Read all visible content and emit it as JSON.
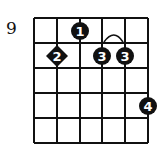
{
  "diagram": {
    "type": "guitar-chord-diagram",
    "start_fret_label": "9",
    "strings": 6,
    "frets": 5,
    "fingers": [
      {
        "finger": "1",
        "string": 3,
        "fret": 1,
        "shape": "circle"
      },
      {
        "finger": "2",
        "string": 2,
        "fret": 2,
        "shape": "diamond"
      },
      {
        "finger": "3",
        "string": 4,
        "fret": 2,
        "shape": "circle"
      },
      {
        "finger": "3",
        "string": 5,
        "fret": 2,
        "shape": "circle"
      },
      {
        "finger": "4",
        "string": 6,
        "fret": 4,
        "shape": "circle"
      }
    ],
    "barre": {
      "finger": "3",
      "from_string": 4,
      "to_string": 5,
      "fret": 2
    }
  }
}
